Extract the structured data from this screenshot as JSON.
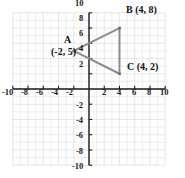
{
  "chart_data": {
    "type": "scatter",
    "title": "",
    "xlabel": "",
    "ylabel": "",
    "xlim": [
      -10,
      10
    ],
    "ylim": [
      -10,
      10
    ],
    "grid": true,
    "legend": "none",
    "shape": "triangle",
    "x_ticks": [
      -10,
      -8,
      -6,
      -4,
      -2,
      2,
      4,
      6,
      8,
      10
    ],
    "y_ticks": [
      -10,
      -8,
      -6,
      -4,
      -2,
      2,
      4,
      6,
      8,
      10
    ],
    "x_tick_labels": [
      "-10",
      "-8",
      "-6",
      "-4",
      "-2",
      "2",
      "4",
      "6",
      "8",
      "10"
    ],
    "y_tick_labels": [
      "-10",
      "-8",
      "-6",
      "-4",
      "-2",
      "2",
      "4",
      "6",
      "8",
      "10"
    ],
    "points": [
      {
        "name": "A",
        "x": -2,
        "y": 5,
        "label": "A",
        "coord_text": "(-2, 5)"
      },
      {
        "name": "B",
        "x": 4,
        "y": 8,
        "label": "B (4, 8)",
        "coord_text": "(4, 8)"
      },
      {
        "name": "C",
        "x": 4,
        "y": 2,
        "label": "C (4, 2)",
        "coord_text": "(4, 2)"
      }
    ],
    "edges": [
      [
        "A",
        "B"
      ],
      [
        "B",
        "C"
      ],
      [
        "C",
        "A"
      ]
    ],
    "colors": {
      "line": "#8c8c8c",
      "point": "#6e6e6e",
      "axis": "#1a1a1a",
      "grid": "#e3e3e3",
      "background": "#ffffff",
      "text": "#111111"
    }
  },
  "labels": {
    "a_letter": "A",
    "a_coords": "(-2, 5)",
    "b_full": "B (4, 8)",
    "c_full": "C (4, 2)"
  },
  "x_axis": {
    "neg": [
      "-10",
      "-8",
      "-6",
      "-4",
      "-2"
    ],
    "pos": [
      "2",
      "4",
      "6",
      "8",
      "10"
    ]
  },
  "y_axis": {
    "pos": [
      "10",
      "8",
      "6",
      "4",
      "2"
    ],
    "neg": [
      "-2",
      "-4",
      "-6",
      "-8",
      "-10"
    ]
  }
}
